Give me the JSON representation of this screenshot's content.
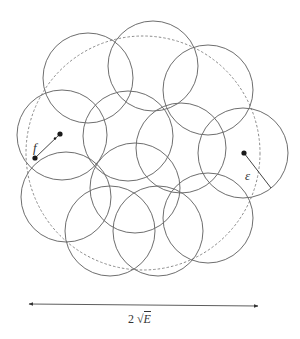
{
  "diagram": {
    "type": "epsilon-covering",
    "colors": {
      "circle_stroke": "#6e6e6e",
      "dashed_stroke": "#8a8a8a",
      "point_fill": "#1a1a1a",
      "line": "#444444"
    },
    "outer_circle": {
      "cx": 143,
      "cy": 153,
      "r": 117,
      "style": "dashed"
    },
    "cover_radius": 45,
    "cover_circles": [
      {
        "id": "A",
        "cx": 88,
        "cy": 78
      },
      {
        "id": "B",
        "cx": 153,
        "cy": 66
      },
      {
        "id": "C",
        "cx": 208,
        "cy": 90
      },
      {
        "id": "D",
        "cx": 62,
        "cy": 135
      },
      {
        "id": "H",
        "cx": 128,
        "cy": 136
      },
      {
        "id": "I",
        "cx": 181,
        "cy": 148
      },
      {
        "id": "F",
        "cx": 243,
        "cy": 153
      },
      {
        "id": "E",
        "cx": 66,
        "cy": 197
      },
      {
        "id": "J",
        "cx": 135,
        "cy": 188
      },
      {
        "id": "G",
        "cx": 208,
        "cy": 218
      },
      {
        "id": "K",
        "cx": 110,
        "cy": 231
      },
      {
        "id": "L",
        "cx": 158,
        "cy": 231
      }
    ],
    "f_segment": {
      "x1": 35,
      "y1": 158,
      "x2": 60,
      "y2": 134,
      "label": "f",
      "label_x": 33,
      "label_y": 140
    },
    "epsilon_radius": {
      "x1": 244,
      "y1": 153,
      "x2": 271,
      "y2": 188,
      "label": "ε",
      "label_x": 245,
      "label_y": 168
    },
    "dimension_arrow": {
      "x1": 29,
      "y1": 304,
      "x2": 258,
      "y2": 306,
      "label_prefix": "2",
      "label_sqrt_var": "E"
    }
  }
}
